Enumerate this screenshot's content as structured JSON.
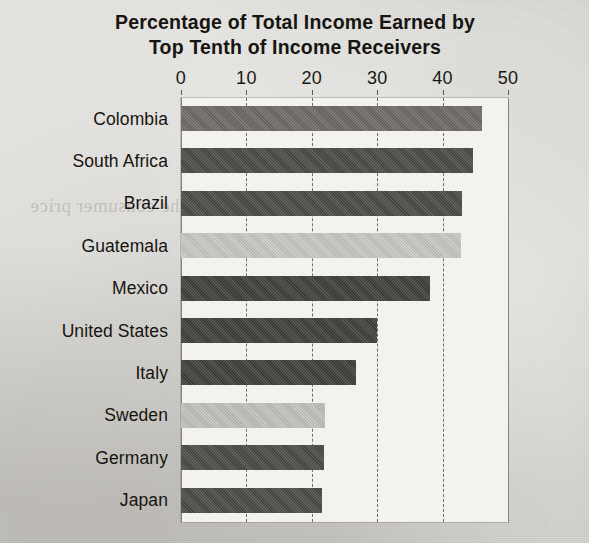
{
  "chart_data": {
    "type": "bar",
    "orientation": "horizontal",
    "title": "Percentage of Total Income Earned by Top Tenth of Income Receivers",
    "title_line1": "Percentage of Total Income Earned by",
    "title_line2": "Top Tenth of Income Receivers",
    "xlabel": "",
    "ylabel": "",
    "xlim": [
      0,
      50
    ],
    "xticks": [
      0,
      10,
      20,
      30,
      40,
      50
    ],
    "xtick_labels": [
      "0",
      "10",
      "20",
      "30",
      "40",
      "50"
    ],
    "grid": true,
    "grid_axis": "x",
    "legend": false,
    "axis_position": "top",
    "categories": [
      "Colombia",
      "South Africa",
      "Brazil",
      "Guatemala",
      "Mexico",
      "United States",
      "Italy",
      "Sweden",
      "Germany",
      "Japan"
    ],
    "values": [
      46.1,
      44.7,
      43.0,
      42.8,
      38.1,
      30.0,
      26.7,
      22.0,
      21.9,
      21.6
    ],
    "bar_colors": [
      "#6d6a65",
      "#4b4945",
      "#4b4945",
      "#c9c7c2",
      "#403e3a",
      "#403e3a",
      "#403e3a",
      "#c2c0bb",
      "#4b4945",
      "#4b4945"
    ]
  },
  "colors": {
    "plot_background": "#f3f2ef",
    "page_background": "#cecdc8",
    "text": "#17150f",
    "gridline": "#6f6c65"
  },
  "bleed_text": {
    "a": "the consumer price",
    "b": "income of such",
    "c": "economic",
    "d": "in the distribution",
    "e": "measured income",
    "f": "for its people"
  }
}
